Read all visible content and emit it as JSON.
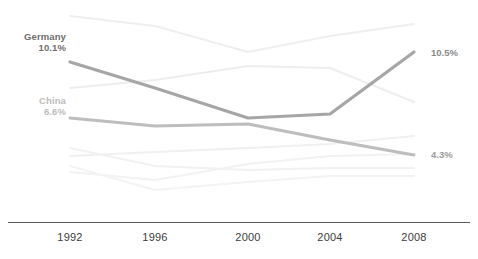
{
  "chart_data": {
    "type": "line",
    "title": "",
    "subtitle": "",
    "xlabel": "",
    "ylabel": "",
    "grid": false,
    "legend_position": "inline-labels",
    "x": [
      1992,
      1996,
      2000,
      2004,
      2008
    ],
    "tick_labels": [
      "1992",
      "1996",
      "2000",
      "2004",
      "2008"
    ],
    "ylim": [
      3.5,
      13.5
    ],
    "axis_line_color": "#5a5a5a",
    "series": [
      {
        "name": "Germany",
        "highlight": true,
        "color": "#a6a6a6",
        "width": 3.2,
        "start_label": "Germany",
        "start_value_label": "10.1%",
        "end_value_label": "10.5%",
        "values": [
          10.1,
          8.6,
          7.2,
          6.5,
          10.5
        ],
        "pixel_points": [
          [
            70,
            62
          ],
          [
            155,
            88
          ],
          [
            248,
            118
          ],
          [
            330,
            114
          ],
          [
            414,
            52
          ]
        ]
      },
      {
        "name": "China",
        "highlight": true,
        "color": "#bdbdbd",
        "width": 3.0,
        "start_label": "China",
        "start_value_label": "6.6%",
        "end_value_label": "4.3%",
        "values": [
          6.6,
          7.0,
          7.1,
          5.6,
          4.3
        ],
        "pixel_points": [
          [
            70,
            118
          ],
          [
            155,
            126
          ],
          [
            248,
            124
          ],
          [
            330,
            140
          ],
          [
            414,
            155
          ]
        ]
      },
      {
        "name": "context-series-1",
        "highlight": false,
        "color": "#efefef",
        "width": 2.0,
        "values": [
          12.6,
          11.9,
          10.6,
          11.4,
          12.1
        ],
        "pixel_points": [
          [
            70,
            16
          ],
          [
            155,
            26
          ],
          [
            248,
            52
          ],
          [
            330,
            36
          ],
          [
            414,
            24
          ]
        ]
      },
      {
        "name": "context-series-2",
        "highlight": false,
        "color": "#eeeeee",
        "width": 2.0,
        "values": [
          9.2,
          9.6,
          10.3,
          10.2,
          7.7
        ],
        "pixel_points": [
          [
            70,
            88
          ],
          [
            155,
            80
          ],
          [
            248,
            66
          ],
          [
            330,
            68
          ],
          [
            414,
            102
          ]
        ]
      },
      {
        "name": "context-series-3",
        "highlight": false,
        "color": "#f0f0f0",
        "width": 2.0,
        "values": [
          5.6,
          5.9,
          6.1,
          6.4,
          6.9
        ],
        "pixel_points": [
          [
            70,
            156
          ],
          [
            155,
            152
          ],
          [
            248,
            148
          ],
          [
            330,
            144
          ],
          [
            414,
            136
          ]
        ]
      },
      {
        "name": "context-series-4",
        "highlight": false,
        "color": "#f1f1f1",
        "width": 2.0,
        "values": [
          6.1,
          5.4,
          5.2,
          5.3,
          5.3
        ],
        "pixel_points": [
          [
            70,
            148
          ],
          [
            155,
            166
          ],
          [
            248,
            170
          ],
          [
            330,
            168
          ],
          [
            414,
            168
          ]
        ]
      },
      {
        "name": "context-series-5",
        "highlight": false,
        "color": "#f2f2f2",
        "width": 2.0,
        "values": [
          4.8,
          4.6,
          5.1,
          5.5,
          5.6
        ],
        "pixel_points": [
          [
            70,
            172
          ],
          [
            155,
            180
          ],
          [
            248,
            164
          ],
          [
            330,
            156
          ],
          [
            414,
            154
          ]
        ]
      },
      {
        "name": "context-series-6",
        "highlight": false,
        "color": "#f3f3f3",
        "width": 2.0,
        "values": [
          5.1,
          4.4,
          4.7,
          4.9,
          4.9
        ],
        "pixel_points": [
          [
            70,
            166
          ],
          [
            155,
            190
          ],
          [
            248,
            182
          ],
          [
            330,
            176
          ],
          [
            414,
            176
          ]
        ]
      }
    ]
  },
  "labels": {
    "germany_name": "Germany",
    "germany_start_value": "10.1%",
    "germany_end_value": "10.5%",
    "china_name": "China",
    "china_start_value": "6.6%",
    "china_end_value": "4.3%"
  },
  "axis": {
    "ticks": [
      "1992",
      "1996",
      "2000",
      "2004",
      "2008"
    ]
  }
}
